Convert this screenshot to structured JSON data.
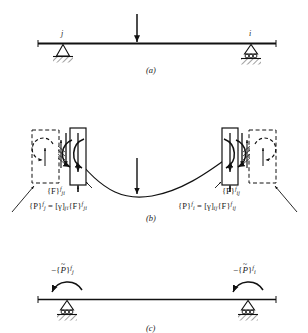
{
  "figure": {
    "type": "structural-analysis-beam-diagram",
    "panels": [
      {
        "id": "a",
        "caption": "(a)",
        "description": "Simply supported beam with concentrated mid-span load",
        "node_left_label": "j",
        "node_right_label": "i",
        "left_support": "pinned",
        "right_support": "roller",
        "load": "concentrated-downward-arrow"
      },
      {
        "id": "b",
        "caption": "(b)",
        "description": "Deflected member with fixed-end forces and moments at joints j and i",
        "left_force_label": "{F}",
        "left_force_sup": "f",
        "left_force_sub": "ji",
        "right_force_label": "{F}",
        "right_force_sup": "f",
        "right_force_sub": "ij",
        "left_equation": {
          "lhs_bracket": "{P}",
          "lhs_sup": "f",
          "lhs_sub": "j",
          "equals": "=",
          "gamma_bracket_open": "[",
          "gamma": "γ",
          "gamma_bracket_close": "]",
          "gamma_sub": "ji",
          "rhs_bracket": "{F}",
          "rhs_sup": "f",
          "rhs_sub": "ji"
        },
        "right_equation": {
          "lhs_bracket": "{P}",
          "lhs_sup": "f",
          "lhs_sub": "i",
          "equals": "=",
          "gamma_bracket_open": "[",
          "gamma": "γ",
          "gamma_bracket_close": "]",
          "gamma_sub": "ij",
          "rhs_bracket": "{F}",
          "rhs_sup": "f",
          "rhs_sub": "ij"
        }
      },
      {
        "id": "c",
        "caption": "(c)",
        "description": "Equivalent joint loads applied as negative fixed-end actions",
        "left_label": {
          "sign": "−",
          "bracket_open": "{",
          "symbol": "P",
          "tilde": "~",
          "bracket_close": "}",
          "sup": "f",
          "sub": "j"
        },
        "right_label": {
          "sign": "−",
          "bracket_open": "{",
          "symbol": "P",
          "tilde": "~",
          "bracket_close": "}",
          "sup": "f",
          "sub": "i"
        },
        "left_support": "roller",
        "right_support": "roller"
      }
    ],
    "colors": {
      "ink": "#1a1a1a",
      "beam": "#111111",
      "background": "#ffffff"
    }
  }
}
